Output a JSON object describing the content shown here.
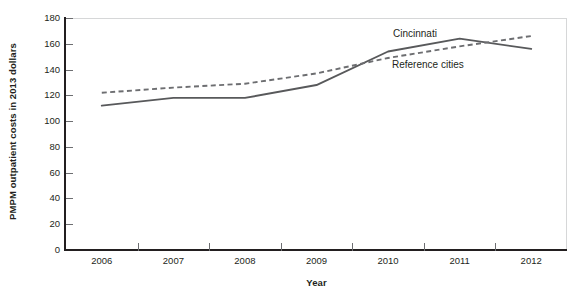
{
  "chart_data": {
    "type": "line",
    "title": "",
    "subtitle": "",
    "xlabel": "Year",
    "ylabel": "PMPM outpatient costs in 2013 dollars",
    "categories": [
      "2006",
      "2007",
      "2008",
      "2009",
      "2010",
      "2011",
      "2012"
    ],
    "x": [
      2006,
      2007,
      2008,
      2009,
      2010,
      2011,
      2012
    ],
    "xlim": [
      2005.5,
      2012.5
    ],
    "ylim": [
      0,
      180
    ],
    "yticks": [
      0,
      20,
      40,
      60,
      80,
      100,
      120,
      140,
      160,
      180
    ],
    "ytick_labels": [
      "0",
      "20",
      "40",
      "60",
      "80",
      "100",
      "120",
      "140",
      "160",
      "180"
    ],
    "grid": false,
    "legend_position": "inline-annotation",
    "series": [
      {
        "name": "Cincinnati",
        "style": "solid",
        "color": "#58595b",
        "values": [
          112,
          118,
          118,
          128,
          154,
          164,
          156
        ]
      },
      {
        "name": "Reference cities",
        "style": "dashed",
        "color": "#6d6e71",
        "values": [
          122,
          126,
          129,
          137,
          149,
          158,
          166
        ]
      }
    ],
    "annotations": [
      {
        "text": "Cincinnati",
        "series": "Cincinnati"
      },
      {
        "text": "Reference cities",
        "series": "Reference cities"
      }
    ]
  },
  "axes": {
    "y_title": "PMPM outpatient costs in 2013 dollars",
    "x_title": "Year",
    "y_ticks": [
      {
        "value": 180,
        "label": "180"
      },
      {
        "value": 160,
        "label": "160"
      },
      {
        "value": 140,
        "label": "140"
      },
      {
        "value": 120,
        "label": "120"
      },
      {
        "value": 100,
        "label": "100"
      },
      {
        "value": 80,
        "label": "80"
      },
      {
        "value": 60,
        "label": "60"
      },
      {
        "value": 40,
        "label": "40"
      },
      {
        "value": 20,
        "label": "20"
      },
      {
        "value": 0,
        "label": "0"
      }
    ],
    "x_ticks": [
      {
        "label": "2006"
      },
      {
        "label": "2007"
      },
      {
        "label": "2008"
      },
      {
        "label": "2009"
      },
      {
        "label": "2010"
      },
      {
        "label": "2011"
      },
      {
        "label": "2012"
      }
    ]
  },
  "labels": {
    "cincinnati": "Cincinnati",
    "reference_cities": "Reference cities"
  },
  "colors": {
    "axis": "#231f20",
    "frame": "#d6d7d8",
    "tick": "#6d6e71",
    "series_solid": "#58595b",
    "series_dashed": "#6d6e71",
    "background": "#ffffff"
  }
}
